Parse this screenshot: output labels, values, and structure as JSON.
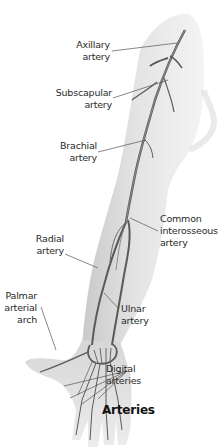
{
  "diagram": {
    "title": "Arteries",
    "colors": {
      "background": "#ffffff",
      "skin_shade": "#d8d8d8",
      "artery": "#5a5a5a",
      "leader_line": "#555555",
      "text": "#2a2a2a"
    },
    "labels": [
      {
        "id": "axillary",
        "line1": "Axillary",
        "line2": "artery",
        "line3": ""
      },
      {
        "id": "subscapular",
        "line1": "Subscapular",
        "line2": "artery",
        "line3": ""
      },
      {
        "id": "brachial",
        "line1": "Brachial",
        "line2": "artery",
        "line3": ""
      },
      {
        "id": "common-interosseous",
        "line1": "Common",
        "line2": "interosseous",
        "line3": "artery"
      },
      {
        "id": "radial",
        "line1": "Radial",
        "line2": "artery",
        "line3": ""
      },
      {
        "id": "palmar-arch",
        "line1": "Palmar",
        "line2": "arterial",
        "line3": "arch"
      },
      {
        "id": "ulnar",
        "line1": "Ulnar",
        "line2": "artery",
        "line3": ""
      },
      {
        "id": "digital",
        "line1": "Digital",
        "line2": "arteries",
        "line3": ""
      }
    ]
  }
}
